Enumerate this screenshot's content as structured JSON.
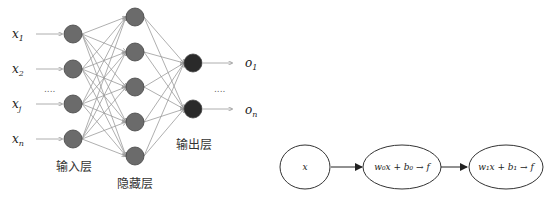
{
  "network": {
    "inputs": [
      "x1",
      "x2",
      "xj",
      "xn"
    ],
    "input_labels": [
      {
        "base": "x",
        "sub": "1"
      },
      {
        "base": "x",
        "sub": "2"
      },
      {
        "base": "x",
        "sub": "j"
      },
      {
        "base": "x",
        "sub": "n"
      }
    ],
    "outputs": [
      {
        "base": "o",
        "sub": "1"
      },
      {
        "base": "o",
        "sub": "n"
      }
    ],
    "input_ellipsis": "....",
    "output_ellipsis": "....",
    "input_layer_label": "输入层",
    "hidden_layer_label": "隐藏层",
    "output_layer_label": "输出层",
    "hidden_count": 5,
    "colors": {
      "input_node": "#6b6b6b",
      "hidden_node": "#6b6b6b",
      "output_node": "#2a2a2a",
      "edge": "#9a9a9a"
    }
  },
  "chain": {
    "nodes": [
      {
        "text": "x"
      },
      {
        "text": "w₀x + b₀ → f"
      },
      {
        "text": "w₁x + b₁ → f"
      }
    ]
  }
}
